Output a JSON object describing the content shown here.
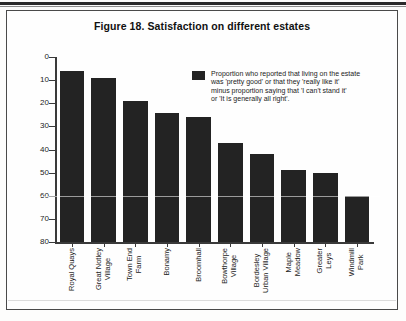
{
  "figure": {
    "title": "Figure 18. Satisfaction on different estates"
  },
  "legend": {
    "swatch_color": "#232323",
    "lines": [
      "Proportion who reported that living on the estate",
      "was 'pretty good' or that they 'really like it'",
      "minus proportion saying that 'I can't stand it'",
      "or 'It is generally all right'."
    ]
  },
  "axis": {
    "y_ticks": [
      "80",
      "70",
      "60",
      "50",
      "40",
      "30",
      "20",
      "10",
      "0"
    ]
  },
  "chart_data": {
    "type": "bar",
    "title": "Figure 18. Satisfaction on different estates",
    "xlabel": "",
    "ylabel": "",
    "ylim": [
      0,
      80
    ],
    "ytick_values": [
      0,
      10,
      20,
      30,
      40,
      50,
      60,
      70,
      80
    ],
    "grid": false,
    "legend_position": "upper right inside plot",
    "bar_color": "#232323",
    "categories": [
      "Royal Quays",
      "Great Notley Village",
      "Town End Farm",
      "Bonamy",
      "Broomhall",
      "Bowthorpe Village",
      "Bordesley Urban Village",
      "Maple Meadow",
      "Greater Leys",
      "Windmill Park"
    ],
    "category_lines": [
      [
        "Royal Quays"
      ],
      [
        "Great Notley",
        "Village"
      ],
      [
        "Town End",
        "Farm"
      ],
      [
        "Bonamy"
      ],
      [
        "Broomhall"
      ],
      [
        "Bowthorpe",
        "Village"
      ],
      [
        "Bordesley",
        "Urban Village"
      ],
      [
        "Maple",
        "Meadow"
      ],
      [
        "Greater",
        "Leys"
      ],
      [
        "Windmill",
        "Park"
      ]
    ],
    "values": [
      74,
      71,
      61,
      56,
      54,
      43,
      38,
      31,
      30,
      20
    ],
    "series": [
      {
        "name": "Proportion who reported that living on the estate was 'pretty good' or that they 'really like it' minus proportion saying that 'I can't stand it' or 'It is generally all right'.",
        "values": [
          74,
          71,
          61,
          56,
          54,
          43,
          38,
          31,
          30,
          20
        ]
      }
    ]
  }
}
